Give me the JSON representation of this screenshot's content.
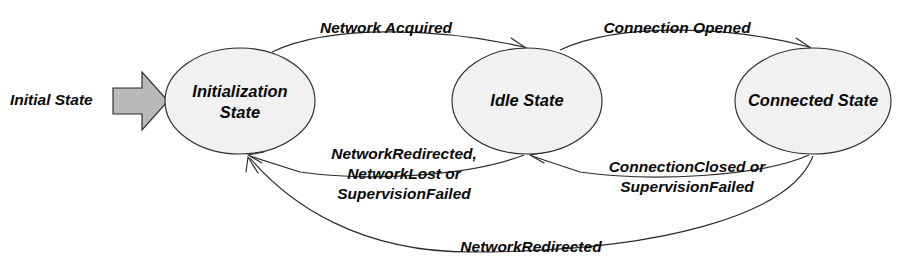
{
  "diagram": {
    "type": "state-machine-diagram",
    "background_color": "#ffffff",
    "state_fill_color": "#f1f1f1",
    "state_stroke_color": "#2b2b2b",
    "start_marker_fill_color": "#b9b9b9",
    "start": {
      "label": "Initial State"
    },
    "states": [
      {
        "id": "initialization",
        "line1": "Initialization",
        "line2": "State"
      },
      {
        "id": "idle",
        "line1": "Idle State",
        "line2": ""
      },
      {
        "id": "connected",
        "line1": "Connected State",
        "line2": ""
      }
    ],
    "transitions": [
      {
        "id": "init-to-idle",
        "from": "Initialization State",
        "to": "Idle State",
        "line1": "Network Acquired",
        "line2": "",
        "line3": ""
      },
      {
        "id": "idle-to-connected",
        "from": "Idle State",
        "to": "Connected State",
        "line1": "Connection Opened",
        "line2": "",
        "line3": ""
      },
      {
        "id": "idle-to-init",
        "from": "Idle State",
        "to": "Initialization State",
        "line1": "NetworkRedirected,",
        "line2": "NetworkLost or",
        "line3": "SupervisionFailed"
      },
      {
        "id": "connected-to-idle",
        "from": "Connected State",
        "to": "Idle State",
        "line1": "ConnectionClosed or",
        "line2": "SupervisionFailed",
        "line3": ""
      },
      {
        "id": "connected-to-init",
        "from": "Connected State",
        "to": "Initialization State",
        "line1": "NetworkRedirected",
        "line2": "",
        "line3": ""
      }
    ]
  }
}
